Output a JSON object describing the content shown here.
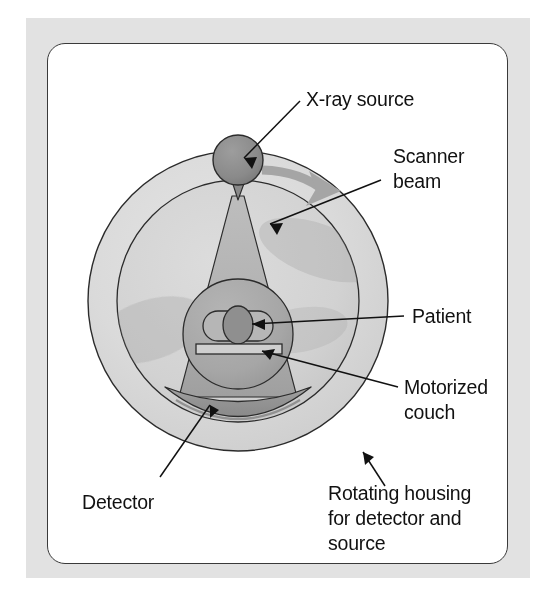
{
  "figure": {
    "frame_color": "#e2e2e2",
    "panel_color": "#ffffff",
    "panel_border_color": "#3a3a3a"
  },
  "labels": {
    "xray_source": "X-ray source",
    "scanner_beam_line1": "Scanner",
    "scanner_beam_line2": "beam",
    "patient": "Patient",
    "motorized_couch_line1": "Motorized",
    "motorized_couch_line2": "couch",
    "detector": "Detector",
    "rotating_housing_line1": "Rotating housing",
    "rotating_housing_line2": "for detector and",
    "rotating_housing_line3": "source"
  },
  "parts": {
    "housing_ring": "rotating-housing-ring",
    "bore_ring": "scanner-bore-ring",
    "rotation_arrow": "rotation-direction-arrow",
    "source": "x-ray-source-tube",
    "collimator": "source-collimator",
    "beam": "fan-beam",
    "patient_body": "patient-body-cross-section",
    "patient_spine": "patient-spine",
    "couch": "motorized-couch",
    "detector_arc": "detector-array-arc"
  },
  "colors": {
    "housing_fill": "#d9d9d9",
    "bore_fill": "#d2d2d2",
    "beam_fill": "#b3b3b3",
    "source_fill": "#8c8c8c",
    "patient_fill": "#a8a8a8",
    "spine_fill": "#8f8f8f",
    "detector_fill": "#9a9a9a",
    "arrow_fill": "#a5a5a5",
    "stroke": "#2b2b2b"
  }
}
